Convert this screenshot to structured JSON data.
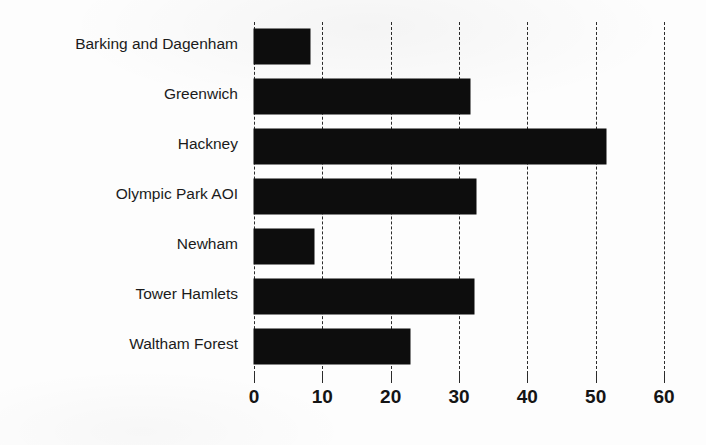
{
  "chart_data": {
    "type": "bar",
    "orientation": "horizontal",
    "title": "",
    "xlabel": "",
    "ylabel": "",
    "categories": [
      "Barking and Dagenham",
      "Greenwich",
      "Hackney",
      "Olympic Park AOI",
      "Newham",
      "Tower Hamlets",
      "Waltham Forest"
    ],
    "values": [
      8.2,
      31.6,
      51.5,
      32.5,
      8.8,
      32.2,
      22.8
    ],
    "xlim": [
      0,
      60
    ],
    "xticks": [
      0,
      10,
      20,
      30,
      40,
      50,
      60
    ],
    "xtick_labels": [
      "0",
      "10",
      "20",
      "30",
      "40",
      "50",
      "60"
    ],
    "grid": true,
    "grid_axis": "x",
    "grid_style": "dashed",
    "legend": false,
    "bar_color": "#0d0d0d",
    "grid_color": "#2b2b2b",
    "background_color": "#ffffff"
  },
  "axis": {
    "tick_0": "0",
    "tick_1": "10",
    "tick_2": "20",
    "tick_3": "30",
    "tick_4": "40",
    "tick_5": "50",
    "tick_6": "60"
  },
  "labels": {
    "cat_0": "Barking and Dagenham",
    "cat_1": "Greenwich",
    "cat_2": "Hackney",
    "cat_3": "Olympic Park AOI",
    "cat_4": "Newham",
    "cat_5": "Tower Hamlets",
    "cat_6": "Waltham Forest"
  }
}
